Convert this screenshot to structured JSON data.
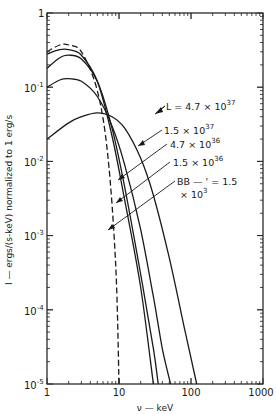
{
  "chart_data": {
    "type": "line",
    "title": "",
    "xlabel": "ν — keV",
    "ylabel": "I — ergs/(s-keV) normalized to 1 erg/s",
    "xscale": "log",
    "yscale": "log",
    "xlim": [
      1,
      1000
    ],
    "ylim": [
      1e-05,
      1
    ],
    "grid": false,
    "x_ticks": [
      "1",
      "10",
      "100",
      "1000"
    ],
    "y_ticks": [
      "10^-5",
      "10^-4",
      "10^-3",
      "10^-2",
      "10^-1",
      "1"
    ],
    "series": [
      {
        "name": "L = 4.7 × 10^37",
        "style": "solid",
        "x": [
          1,
          2,
          3,
          5,
          8,
          12,
          20,
          30,
          50,
          80,
          120
        ],
        "y": [
          0.02,
          0.033,
          0.04,
          0.045,
          0.04,
          0.028,
          0.011,
          0.0035,
          0.0005,
          6e-05,
          1e-05
        ]
      },
      {
        "name": "1.5 × 10^37",
        "style": "solid",
        "x": [
          1,
          1.5,
          2,
          3,
          5,
          8,
          12,
          20,
          30,
          40,
          52
        ],
        "y": [
          0.1,
          0.125,
          0.13,
          0.12,
          0.075,
          0.03,
          0.009,
          0.0012,
          0.00015,
          3e-05,
          1e-05
        ]
      },
      {
        "name": "4.7 × 10^36",
        "style": "solid",
        "x": [
          1,
          1.5,
          2,
          3,
          5,
          8,
          12,
          20,
          30,
          35
        ],
        "y": [
          0.18,
          0.25,
          0.27,
          0.24,
          0.12,
          0.028,
          0.0045,
          0.0003,
          3e-05,
          1e-05
        ]
      },
      {
        "name": "1.5 × 10^36",
        "style": "solid",
        "x": [
          1,
          1.5,
          2,
          3,
          5,
          8,
          12,
          20,
          30
        ],
        "y": [
          0.28,
          0.32,
          0.32,
          0.27,
          0.12,
          0.022,
          0.003,
          0.0002,
          1e-05
        ]
      },
      {
        "name": "BB — L = 1.5 × 10^3",
        "style": "dashed",
        "x": [
          1,
          1.5,
          2,
          3,
          5,
          7,
          9,
          10
        ],
        "y": [
          0.3,
          0.37,
          0.37,
          0.3,
          0.09,
          0.012,
          0.0004,
          1e-05
        ]
      }
    ],
    "annotations": [
      "L = 4.7 × 10^37",
      "1.5 × 10^37",
      "4.7 × 10^36",
      "1.5 × 10^36",
      "BB — ' = 1.5 × 10^3"
    ]
  },
  "axes": {
    "xlabel": "ν — keV",
    "ylabel": "I — ergs/(s-keV) normalized to 1 erg/s",
    "x_tick_labels": [
      "1",
      "10",
      "100",
      "1000"
    ],
    "y_tick_base": [
      "10",
      "10",
      "10",
      "10",
      "10",
      "1"
    ],
    "y_tick_exp": [
      "-5",
      "-4",
      "-3",
      "-2",
      "-1",
      ""
    ]
  },
  "labels": {
    "l1_base": "L = 4.7 × 10",
    "l1_exp": "37",
    "l2_base": "1.5 × 10",
    "l2_exp": "37",
    "l3_base": "4.7 × 10",
    "l3_exp": "36",
    "l4_base": "1.5 × 10",
    "l4_exp": "36",
    "bb_line1": "BB — ' = 1.5",
    "bb_line2_base": "× 10",
    "bb_line2_exp": "3"
  }
}
